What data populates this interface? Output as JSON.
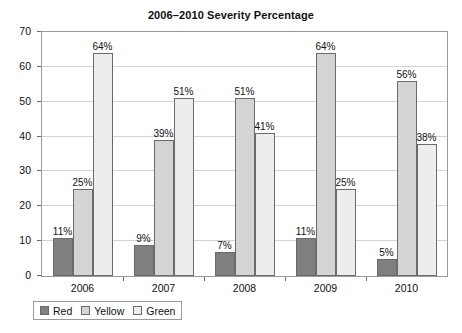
{
  "chart_data": {
    "type": "bar",
    "title": "2006–2010 Severity Percentage",
    "xlabel": "",
    "ylabel": "",
    "ylim": [
      0,
      70
    ],
    "ytick_step": 10,
    "yticks": [
      0,
      10,
      20,
      30,
      40,
      50,
      60,
      70
    ],
    "ytick_labels": [
      "0",
      "10",
      "20",
      "30",
      "40",
      "50",
      "60",
      "70"
    ],
    "categories": [
      "2006",
      "2007",
      "2008",
      "2009",
      "2010"
    ],
    "grid": true,
    "legend_position": "bottom-left",
    "value_labels_suffix": "%",
    "series": [
      {
        "name": "Red",
        "color": "#7f7f7f",
        "values": [
          11,
          9,
          7,
          11,
          5
        ],
        "labels": [
          "11%",
          "9%",
          "7%",
          "11%",
          "5%"
        ]
      },
      {
        "name": "Yellow",
        "color": "#d4d4d4",
        "values": [
          25,
          39,
          51,
          64,
          56
        ],
        "labels": [
          "25%",
          "39%",
          "51%",
          "64%",
          "56%"
        ]
      },
      {
        "name": "Green",
        "color": "#ededed",
        "values": [
          64,
          51,
          41,
          25,
          38
        ],
        "labels": [
          "64%",
          "51%",
          "41%",
          "25%",
          "38%"
        ]
      }
    ]
  }
}
